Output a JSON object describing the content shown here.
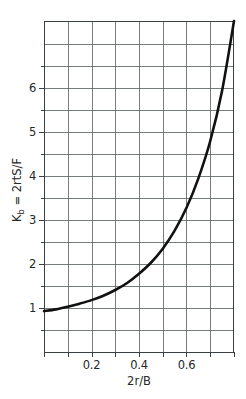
{
  "chart_data": {
    "type": "line",
    "title": "",
    "xlabel": "2r/B",
    "ylabel_main": "= 2rtS/F",
    "ylabel_symbol": "K",
    "ylabel_subscript": "b",
    "ylabel_full": "K_b = 2rtS/F",
    "xlim": [
      0.0,
      0.8
    ],
    "ylim": [
      0.0,
      7.53
    ],
    "grid": true,
    "legend": null,
    "x_major_ticks": [
      0.2,
      0.4,
      0.6
    ],
    "x_major_tick_labels": [
      "0.2",
      "0.4",
      "0.6"
    ],
    "x_gridline_values": [
      0.0,
      0.1,
      0.2,
      0.3,
      0.4,
      0.5,
      0.6,
      0.7,
      0.8
    ],
    "y_major_ticks": [
      1,
      2,
      3,
      4,
      5,
      6
    ],
    "y_major_tick_labels": [
      "1",
      "2",
      "3",
      "4",
      "5",
      "6"
    ],
    "y_gridline_values": [
      0.5,
      1.0,
      1.5,
      2.0,
      2.5,
      3.0,
      3.5,
      4.0,
      4.5,
      5.0,
      5.5,
      6.0,
      6.5,
      7.0
    ],
    "series": [
      {
        "name": "Kb curve",
        "color": "#111111",
        "x": [
          0.0,
          0.05,
          0.1,
          0.15,
          0.2,
          0.25,
          0.3,
          0.35,
          0.4,
          0.45,
          0.5,
          0.55,
          0.6,
          0.65,
          0.7,
          0.75,
          0.8
        ],
        "values": [
          0.93,
          0.97,
          1.03,
          1.1,
          1.18,
          1.28,
          1.41,
          1.57,
          1.78,
          2.03,
          2.35,
          2.76,
          3.28,
          3.95,
          4.8,
          5.95,
          7.53
        ]
      }
    ]
  },
  "axes": {
    "x_axis_name": "2r/B",
    "y_axis_name": "Kb = 2rtS/F"
  }
}
